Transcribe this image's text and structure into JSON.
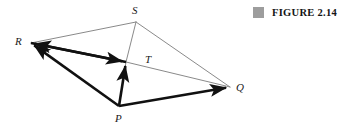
{
  "figure": {
    "caption_marker": "gray-square-icon",
    "caption_text": "FIGURE 2.14",
    "caption_marker_color": "#9d9d9d",
    "background_color": "#ffffff"
  },
  "diagram": {
    "type": "vector-geometry-diagram",
    "thin_line_color": "#8a8a8a",
    "thin_line_width": 1,
    "bold_line_color": "#111111",
    "bold_line_width": 2.6,
    "points": [
      {
        "id": "R",
        "label": "R",
        "x": 31,
        "y": 43,
        "label_x": 15,
        "label_y": 36
      },
      {
        "id": "S",
        "label": "S",
        "x": 136,
        "y": 22,
        "label_x": 132,
        "label_y": 5
      },
      {
        "id": "T",
        "label": "T",
        "x": 126,
        "y": 62,
        "label_x": 145,
        "label_y": 54
      },
      {
        "id": "P",
        "label": "P",
        "x": 119,
        "y": 106,
        "label_x": 115,
        "label_y": 113
      },
      {
        "id": "Q",
        "label": "Q",
        "x": 230,
        "y": 87,
        "label_x": 236,
        "label_y": 82
      }
    ],
    "thin_segments": [
      {
        "name": "segment-R-S",
        "from": "R",
        "to": "S"
      },
      {
        "name": "segment-S-Q",
        "from": "S",
        "to": "Q"
      },
      {
        "name": "segment-S-T",
        "from": "S",
        "to": "T"
      },
      {
        "name": "segment-T-P",
        "from": "T",
        "to": "P"
      },
      {
        "name": "segment-R-T",
        "from": "R",
        "to": "T"
      },
      {
        "name": "segment-T-Q",
        "from": "T",
        "to": "Q"
      }
    ],
    "bold_arrows": [
      {
        "name": "vector-P-Q",
        "from": "P",
        "to": "Q"
      },
      {
        "name": "vector-P-R",
        "from": "P",
        "to": "R"
      },
      {
        "name": "vector-P-T",
        "from": "P",
        "to": "T"
      },
      {
        "name": "vector-R-T",
        "from": "R",
        "to": "T"
      },
      {
        "name": "vector-T-R",
        "from": "T",
        "to": "R"
      }
    ]
  }
}
